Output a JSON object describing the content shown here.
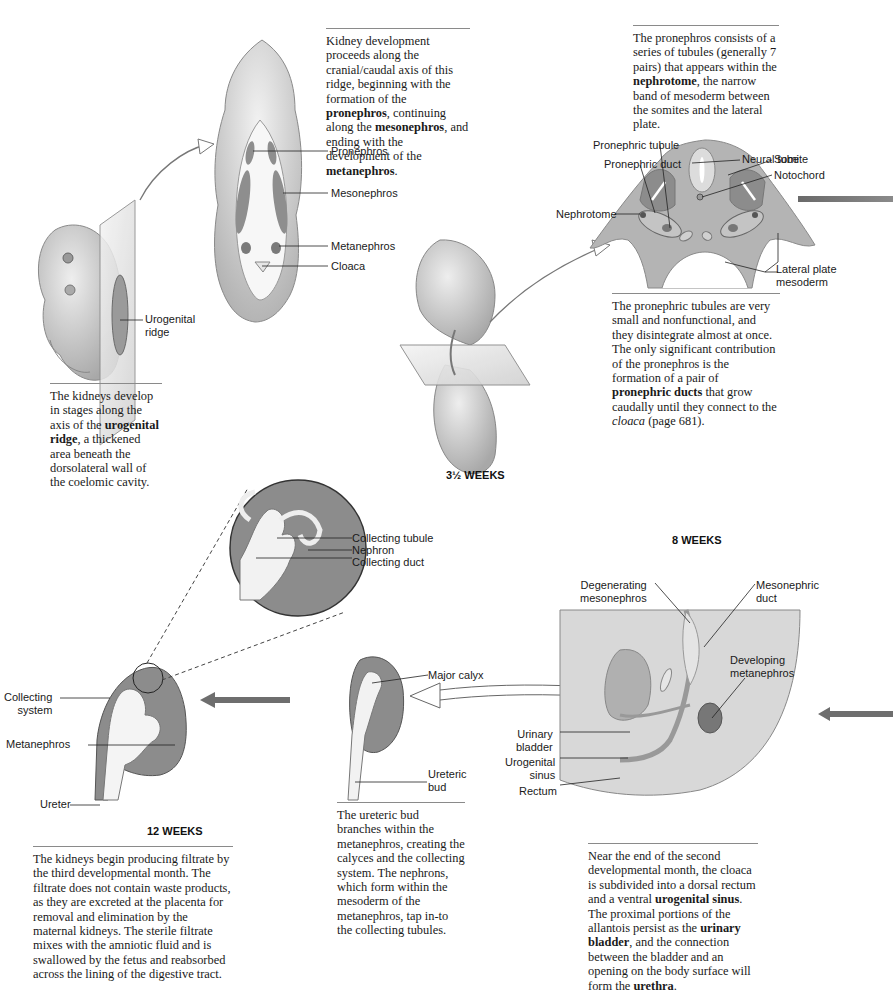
{
  "panel_1": {
    "caption_parts": {
      "a": "The kidneys develop in stages along the axis of the ",
      "b": "urogenital ridge",
      "c": ", a thickened area beneath the dorsolateral wall of the coelomic cavity."
    },
    "labels": {
      "urogenital_ridge": "Urogenital\nridge"
    }
  },
  "panel_2": {
    "caption_parts": {
      "a": "Kidney development proceeds along the cranial/caudal axis of this ridge, beginning with the formation of the ",
      "b": "pronephros",
      "c": ", continuing along the ",
      "d": "mesonephros",
      "e": ", and ending with the development of the ",
      "f": "metanephros",
      "g": "."
    },
    "labels": {
      "pronephros": "Pronephros",
      "mesonephros": "Mesonephros",
      "metanephros": "Metanephros",
      "cloaca": "Cloaca"
    }
  },
  "panel_3": {
    "stage": "3½ WEEKS",
    "caption_top_parts": {
      "a": "The pronephros consists of a series of tubules (generally 7 pairs) that appears within the ",
      "b": "nephrotome",
      "c": ", the narrow band of mesoderm between the somites and the lateral plate."
    },
    "caption_bottom_parts": {
      "a": "The pronephric tubules are very small and nonfunctional, and they disintegrate almost at once. The only significant contribution of the pronephros is the formation of a pair of ",
      "b": "pronephric ducts",
      "c": " that grow caudally until they connect to the ",
      "d": "cloaca",
      "e": " (page 681)."
    },
    "labels": {
      "pronephric_tubule": "Pronephric tubule",
      "pronephric_duct": "Pronephric duct",
      "nephrotome": "Nephrotome",
      "neural_tube": "Neural tube",
      "somite": "Somite",
      "notochord": "Notochord",
      "lateral_plate_mesoderm": "Lateral plate\nmesoderm"
    }
  },
  "panel_4": {
    "stage": "8 WEEKS",
    "caption_parts": {
      "a": "Near the end of the second developmental month, the cloaca is subdivided into a dorsal rectum and a ventral ",
      "b": "urogenital sinus",
      "c": ". The proximal portions of the allantois persist as the ",
      "d": "urinary bladder",
      "e": ", and the connection between the bladder and an opening on the body surface will form the ",
      "f": "urethra",
      "g": "."
    },
    "labels": {
      "degenerating_mesonephros": "Degenerating\nmesonephros",
      "mesonephric_duct": "Mesonephric\nduct",
      "developing_metanephros": "Developing\nmetanephros",
      "urinary_bladder": "Urinary\nbladder",
      "urogenital_sinus": "Urogenital\nsinus",
      "rectum": "Rectum"
    }
  },
  "panel_5": {
    "caption": "The ureteric bud branches within the metanephros, creating the calyces and the collecting system. The nephrons, which form within the mesoderm of the metanephros, tap in-to the collecting tubules.",
    "labels": {
      "major_calyx": "Major calyx",
      "ureteric_bud": "Ureteric\nbud"
    }
  },
  "panel_6": {
    "stage": "12 WEEKS",
    "caption": "The kidneys begin producing filtrate by the third developmental month. The filtrate does not contain waste products, as they are excreted at the placenta for removal and elimination by the maternal kidneys. The sterile filtrate mixes with the amniotic fluid and is swallowed by the fetus and reabsorbed across the lining of the digestive tract.",
    "labels": {
      "collecting_system": "Collecting\nsystem",
      "metanephros": "Metanephros",
      "ureter": "Ureter",
      "collecting_tubule": "Collecting tubule",
      "nephron": "Nephron",
      "collecting_duct": "Collecting duct"
    }
  },
  "colors": {
    "tissue_dark": "#8c8c8c",
    "tissue_mid": "#b5b5b5",
    "tissue_light": "#dcdcdc",
    "arrow": "#6e6e6e",
    "rule": "#8a8a8a"
  }
}
